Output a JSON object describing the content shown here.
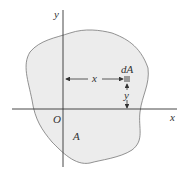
{
  "diagram": {
    "axis_x_label": "x",
    "axis_y_label": "y",
    "origin_label": "O",
    "region_label": "A",
    "element_label": "dA",
    "distance_x_label": "x",
    "distance_y_label": "y",
    "colors": {
      "region_fill": "#ececec",
      "outline": "#777777",
      "axis": "#333333",
      "element": "#9a9a9a"
    }
  }
}
